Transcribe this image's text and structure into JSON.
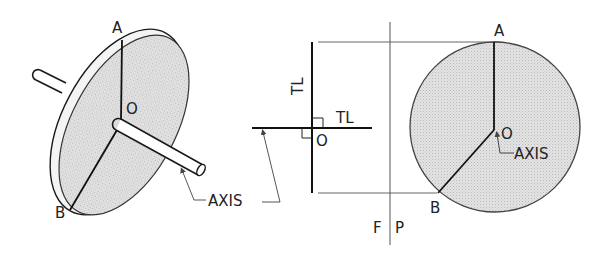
{
  "figure": {
    "colors": {
      "line": "#1a1a1a",
      "thin_line": "#555555",
      "disc_fill": "#dcdcdc",
      "background": "#ffffff"
    }
  },
  "pictorial": {
    "labels": {
      "point_a": "A",
      "point_b": "B",
      "point_o": "O",
      "axis": "AXIS"
    }
  },
  "front_view": {
    "labels": {
      "true_length_vertical": "TL",
      "true_length_horizontal": "TL",
      "point_o": "O"
    }
  },
  "fold_line": {
    "labels": {
      "left": "F",
      "right": "P"
    }
  },
  "profile_view": {
    "labels": {
      "point_a": "A",
      "point_b": "B",
      "point_o": "O",
      "axis": "AXIS"
    }
  }
}
